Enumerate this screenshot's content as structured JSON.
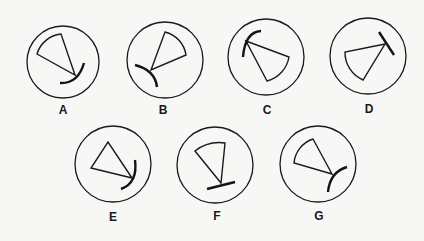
{
  "figure": {
    "type": "multiple-choice-shapes",
    "options": [
      {
        "label": "A",
        "description": "sector with curved end stroke below vertex"
      },
      {
        "label": "B",
        "description": "sector with curved stroke through vertex on left"
      },
      {
        "label": "C",
        "description": "sector with curved stroke at top-left vertex"
      },
      {
        "label": "D",
        "description": "sector with straight bar at upper-right vertex"
      },
      {
        "label": "E",
        "description": "triangle with curved stroke at right vertex"
      },
      {
        "label": "F",
        "description": "sector with straight bar base below vertex"
      },
      {
        "label": "G",
        "description": "sector with curved stroke at right vertex"
      }
    ]
  },
  "colors": {
    "background": "#f7f7f5",
    "stroke": "#1a1a1a"
  }
}
